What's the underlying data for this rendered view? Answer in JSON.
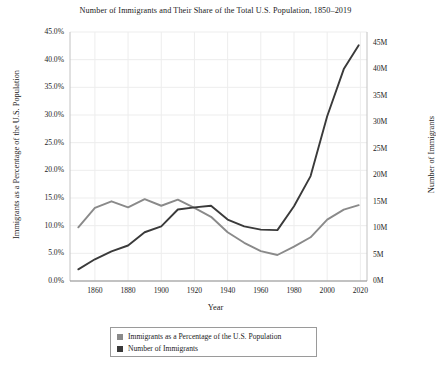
{
  "chart_data": {
    "type": "line",
    "title": "Number of Immigrants and Their Share of the Total U.S. Population, 1850–2019",
    "xlabel": "Year",
    "ylabel": "Immigrants as a Percentage of the U.S. Population",
    "y2label": "Number of Immigrants",
    "x": [
      1850,
      1860,
      1870,
      1880,
      1890,
      1900,
      1910,
      1920,
      1930,
      1940,
      1950,
      1960,
      1970,
      1980,
      1990,
      2000,
      2010,
      2019
    ],
    "xlim": [
      1845,
      2024
    ],
    "xticks": [
      1860,
      1880,
      1900,
      1920,
      1940,
      1960,
      1980,
      2000,
      2020
    ],
    "xtick_labels": [
      "1860",
      "1880",
      "1900",
      "1920",
      "1940",
      "1960",
      "1980",
      "2000",
      "2020"
    ],
    "ylim": [
      0,
      45
    ],
    "yticks": [
      0,
      5,
      10,
      15,
      20,
      25,
      30,
      35,
      40,
      45
    ],
    "ytick_labels": [
      "0.0%",
      "5.0%",
      "10.0%",
      "15.0%",
      "20.0%",
      "25.0%",
      "30.0%",
      "35.0%",
      "40.0%",
      "45.0%"
    ],
    "y2lim": [
      0,
      47
    ],
    "y2ticks": [
      0,
      5,
      10,
      15,
      20,
      25,
      30,
      35,
      40,
      45
    ],
    "y2tick_labels": [
      "0M",
      "5M",
      "10M",
      "15M",
      "20M",
      "25M",
      "30M",
      "35M",
      "40M",
      "45M"
    ],
    "grid": true,
    "legend_position": "below",
    "series": [
      {
        "name": "Immigrants as a Percentage of the U.S. Population",
        "axis": "left",
        "color": "#8a8a8a",
        "unit": "percent",
        "values": [
          9.7,
          13.2,
          14.4,
          13.3,
          14.8,
          13.6,
          14.7,
          13.2,
          11.6,
          8.8,
          6.9,
          5.4,
          4.7,
          6.2,
          7.9,
          11.1,
          12.9,
          13.7
        ]
      },
      {
        "name": "Number of Immigrants",
        "axis": "right",
        "color": "#3a3a3a",
        "unit": "millions",
        "values": [
          2.2,
          4.1,
          5.6,
          6.7,
          9.2,
          10.3,
          13.5,
          13.9,
          14.2,
          11.6,
          10.3,
          9.7,
          9.6,
          14.1,
          19.8,
          31.1,
          40.0,
          44.5
        ]
      }
    ]
  },
  "legend": {
    "entries": [
      {
        "label": "Immigrants as a Percentage of the U.S. Population",
        "color": "#8a8a8a"
      },
      {
        "label": "Number of Immigrants",
        "color": "#3a3a3a"
      }
    ]
  }
}
